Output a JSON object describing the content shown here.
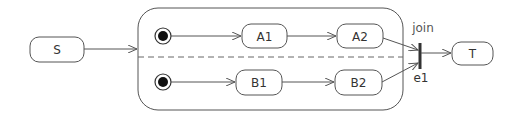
{
  "diagram": {
    "type": "UML state machine with fork/join (orthogonal regions)",
    "states": [
      {
        "id": "S",
        "label": "S"
      },
      {
        "id": "A1",
        "label": "A1"
      },
      {
        "id": "A2",
        "label": "A2"
      },
      {
        "id": "B1",
        "label": "B1"
      },
      {
        "id": "B2",
        "label": "B2"
      },
      {
        "id": "T",
        "label": "T"
      }
    ],
    "composite": {
      "regions": [
        {
          "name": "region-a",
          "initial": true,
          "states": [
            "A1",
            "A2"
          ]
        },
        {
          "name": "region-b",
          "initial": true,
          "states": [
            "B1",
            "B2"
          ]
        }
      ]
    },
    "join": {
      "label": "join",
      "event": "e1"
    },
    "transitions": [
      {
        "from": "S",
        "to": "composite"
      },
      {
        "from": "initial-a",
        "to": "A1"
      },
      {
        "from": "A1",
        "to": "A2"
      },
      {
        "from": "initial-b",
        "to": "B1"
      },
      {
        "from": "B1",
        "to": "B2"
      },
      {
        "from": "A2",
        "to": "join"
      },
      {
        "from": "B2",
        "to": "join"
      },
      {
        "from": "join",
        "to": "T"
      }
    ],
    "colors": {
      "stroke": "#555555",
      "text": "#333333",
      "join_bar": "#333333"
    }
  }
}
